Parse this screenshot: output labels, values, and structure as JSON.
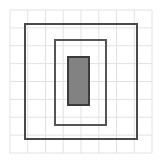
{
  "figure": {
    "title": "",
    "caption": "",
    "background_color": "#ffffff",
    "width": 162,
    "height": 163
  },
  "grid": {
    "name": "graph-paper-grid",
    "line_color": "#e2e2e2",
    "line_width": 1,
    "x_start": 10,
    "y_start": 10,
    "x_end": 152,
    "y_end": 153,
    "columns": 8,
    "rows": 8,
    "cell_width": 17.75,
    "cell_height": 17.875
  },
  "shapes": [
    {
      "name": "outer-rectangle",
      "type": "rect",
      "x": 25,
      "y": 24,
      "width": 112,
      "height": 115,
      "stroke": "#4a4a4a",
      "stroke_width": 2.2,
      "fill": "none",
      "label": "outer frame"
    },
    {
      "name": "middle-rectangle",
      "type": "rect",
      "x": 55,
      "y": 40,
      "width": 51,
      "height": 85,
      "stroke": "#555555",
      "stroke_width": 1.6,
      "fill": "none",
      "label": "middle frame"
    },
    {
      "name": "inner-filled-rectangle",
      "type": "rect",
      "x": 68,
      "y": 57,
      "width": 21,
      "height": 48,
      "stroke": "#3c3c3c",
      "stroke_width": 1.6,
      "fill": "#828282",
      "label": "shaded core"
    }
  ],
  "colors": {
    "grid_line": "#e2e2e2",
    "outer_stroke": "#4a4a4a",
    "middle_stroke": "#555555",
    "inner_stroke": "#3c3c3c",
    "inner_fill": "#828282",
    "background": "#ffffff"
  }
}
